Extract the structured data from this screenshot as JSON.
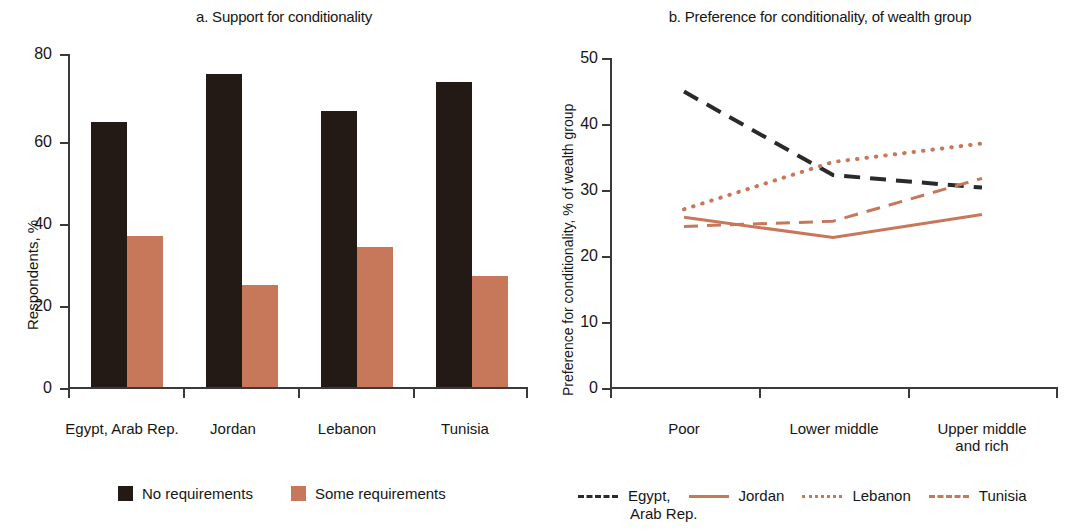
{
  "figure": {
    "background": "#ffffff",
    "colors": {
      "dark": "#231a16",
      "accent": "#c8785a",
      "axis": "#3a3a3a",
      "text": "#161616"
    }
  },
  "panel_a": {
    "title": "a. Support for conditionality",
    "ylabel": "Respondents, %",
    "yticks": [
      "0",
      "20",
      "40",
      "60",
      "80"
    ],
    "categories": [
      "Egypt, Arab Rep.",
      "Jordan",
      "Lebanon",
      "Tunisia"
    ],
    "legend": [
      {
        "label": "No requirements",
        "color": "#231a16",
        "swatch": "square"
      },
      {
        "label": "Some requirements",
        "color": "#c8785a",
        "swatch": "square"
      }
    ]
  },
  "panel_b": {
    "title": "b. Preference for conditionality, of wealth group",
    "ylabel": "Preference for conditionality, % of wealth group",
    "yticks": [
      "0",
      "10",
      "20",
      "30",
      "40",
      "50"
    ],
    "categories": [
      "Poor",
      "Lower middle",
      "Upper middle\nand rich"
    ],
    "legend": [
      {
        "label": "Egypt,",
        "label2": "Arab Rep.",
        "style": "dashed",
        "color": "#2a2a2a"
      },
      {
        "label": "Jordan",
        "style": "solid",
        "color": "#c8785a"
      },
      {
        "label": "Lebanon",
        "style": "dotted",
        "color": "#c8785a"
      },
      {
        "label": "Tunisia",
        "style": "dashed",
        "color": "#c8785a"
      }
    ]
  },
  "chart_data": [
    {
      "type": "bar",
      "panel": "a",
      "title": "a. Support for conditionality",
      "xlabel": "",
      "ylabel": "Respondents, %",
      "ylim": [
        0,
        80
      ],
      "yticks": [
        0,
        20,
        40,
        60,
        80
      ],
      "grid": false,
      "legend_position": "bottom",
      "categories": [
        "Egypt, Arab Rep.",
        "Jordan",
        "Lebanon",
        "Tunisia"
      ],
      "series": [
        {
          "name": "No requirements",
          "color": "#231a16",
          "values": [
            63.7,
            75.2,
            66.3,
            73.3
          ]
        },
        {
          "name": "Some requirements",
          "color": "#c8785a",
          "values": [
            36.2,
            24.4,
            33.6,
            26.6
          ]
        }
      ]
    },
    {
      "type": "line",
      "panel": "b",
      "title": "b. Preference for conditionality, of wealth group",
      "xlabel": "",
      "ylabel": "Preference for conditionality, % of wealth group",
      "ylim": [
        0,
        50
      ],
      "yticks": [
        0,
        10,
        20,
        30,
        40,
        50
      ],
      "grid": false,
      "legend_position": "bottom",
      "categories": [
        "Poor",
        "Lower middle",
        "Upper middle and rich"
      ],
      "series": [
        {
          "name": "Egypt, Arab Rep.",
          "color": "#2a2a2a",
          "style": "dashed",
          "values": [
            44.9,
            32.2,
            30.3
          ]
        },
        {
          "name": "Jordan",
          "color": "#c8785a",
          "style": "solid",
          "values": [
            25.8,
            22.7,
            26.2
          ]
        },
        {
          "name": "Lebanon",
          "color": "#c8785a",
          "style": "dotted",
          "values": [
            27.0,
            34.2,
            37.0
          ]
        },
        {
          "name": "Tunisia",
          "color": "#c8785a",
          "style": "dashed",
          "values": [
            24.4,
            25.2,
            31.7
          ]
        }
      ]
    }
  ]
}
